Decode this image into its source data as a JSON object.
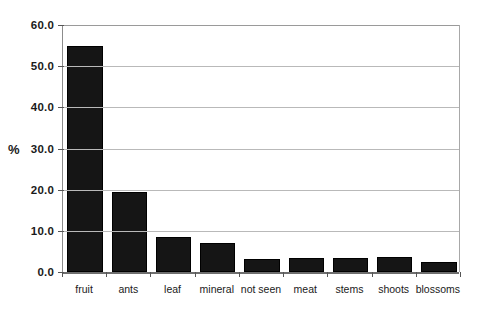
{
  "chart_data": {
    "type": "bar",
    "title": "",
    "subtitle": "",
    "xlabel": "",
    "ylabel": "%",
    "categories": [
      "fruit",
      "ants",
      "leaf",
      "mineral",
      "not seen",
      "meat",
      "stems",
      "shoots",
      "blossoms"
    ],
    "values": [
      55.0,
      19.4,
      8.5,
      7.0,
      3.2,
      3.5,
      3.5,
      3.6,
      2.5
    ],
    "ylim": [
      0.0,
      60.0
    ],
    "ytick_labels": [
      "0.0",
      "10.0",
      "20.0",
      "30.0",
      "40.0",
      "50.0",
      "60.0"
    ],
    "ytick_values": [
      0,
      10,
      20,
      30,
      40,
      50,
      60
    ],
    "grid": "horizontal",
    "legend": "none",
    "bar_color": "#151515",
    "gridline_color": "#b9b9b9",
    "axis_color": "#6e6e6e"
  }
}
